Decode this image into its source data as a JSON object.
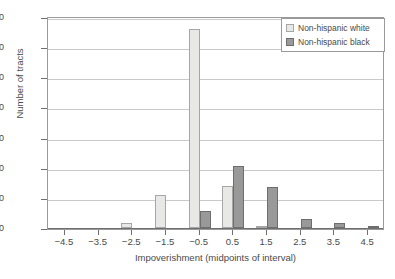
{
  "chart_data": {
    "type": "bar",
    "title": "",
    "xlabel": "Impoverishment (midpoints of interval)",
    "ylabel": "Number of tracts",
    "categories": [
      "-4.5",
      "-3.5",
      "-2.5",
      "-1.5",
      "-0.5",
      "0.5",
      "1.5",
      "2.5",
      "3.5",
      "4.5"
    ],
    "series": [
      {
        "name": "Non-hispanic white",
        "color": "#e8e8e6",
        "values": [
          0,
          0,
          3,
          22,
          132,
          28,
          1,
          0,
          0,
          0
        ]
      },
      {
        "name": "Non-hispanic black",
        "color": "#999999",
        "values": [
          0,
          0,
          0,
          0,
          11,
          41,
          27,
          6,
          3,
          1
        ]
      }
    ],
    "ylim": [
      0,
      140
    ],
    "yticks": [
      0,
      20,
      40,
      60,
      80,
      100,
      120,
      140
    ],
    "xlim": [
      -5,
      5
    ],
    "grid": "horizontal",
    "legend_position": "top-right"
  },
  "legend": {
    "items": [
      {
        "label": "Non-hispanic white",
        "swatch": "white-swatch-icon"
      },
      {
        "label": "Non-hispanic black",
        "swatch": "black-swatch-icon"
      }
    ]
  },
  "caption": ""
}
